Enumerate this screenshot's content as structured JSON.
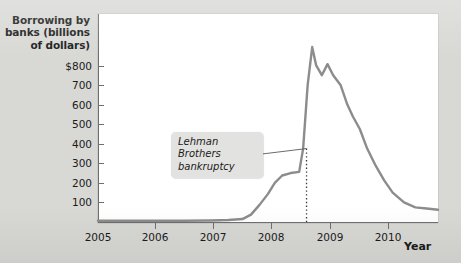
{
  "chart_data": {
    "type": "line",
    "title": "",
    "xlabel": "Year",
    "ylabel": "Borrowing by banks (billions of dollars)",
    "ylabel_lines": [
      "Borrowing by",
      "banks (billions",
      "of dollars)"
    ],
    "xlim": [
      2005,
      2011
    ],
    "ylim": [
      0,
      850
    ],
    "grid": false,
    "legend": "none",
    "line_color": "#8c8c8c",
    "y_ticks": [
      100,
      200,
      300,
      400,
      500,
      600,
      700,
      800
    ],
    "y_tick_labels": [
      "100",
      "200",
      "300",
      "400",
      "500",
      "600",
      "700",
      "$800"
    ],
    "x_ticks": [
      2005,
      2006,
      2007,
      2008,
      2009,
      2010
    ],
    "x_tick_labels": [
      "2005",
      "2006",
      "2007",
      "2008",
      "2009",
      "2010"
    ],
    "series": [
      {
        "name": "Borrowing by banks",
        "x": [
          2005.0,
          2005.5,
          2006.0,
          2006.5,
          2007.0,
          2007.3,
          2007.55,
          2007.7,
          2007.85,
          2008.0,
          2008.12,
          2008.25,
          2008.4,
          2008.55,
          2008.62,
          2008.7,
          2008.78,
          2008.85,
          2008.95,
          2009.05,
          2009.15,
          2009.28,
          2009.4,
          2009.5,
          2009.62,
          2009.75,
          2009.9,
          2010.05,
          2010.2,
          2010.4,
          2010.6,
          2010.8,
          2011.0
        ],
        "y": [
          5,
          5,
          5,
          5,
          6,
          8,
          12,
          30,
          70,
          115,
          160,
          190,
          200,
          205,
          300,
          560,
          715,
          640,
          600,
          645,
          600,
          560,
          480,
          430,
          380,
          300,
          230,
          170,
          120,
          80,
          60,
          55,
          50
        ]
      }
    ],
    "annotations": [
      {
        "name": "lehman-brothers-bankruptcy",
        "text_lines": [
          "Lehman Brothers",
          "bankruptcy"
        ],
        "text": "Lehman Brothers bankruptcy",
        "marker": "dotted-vertical-line",
        "marker_x": 2008.68,
        "marker_y_top": 300,
        "marker_y_bottom": 0
      }
    ]
  },
  "figure": {
    "background_color": "#d8d8d5",
    "plot_background_color": "#ffffff",
    "axis_color": "#6f6f6f",
    "annotation_background_color": "#e2e2e0"
  }
}
